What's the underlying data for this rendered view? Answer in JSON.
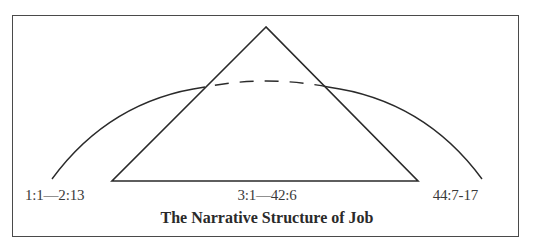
{
  "diagram": {
    "title": "The Narrative Structure of Job",
    "labels": {
      "prologue": "1:1—2:13",
      "dialogue": "3:1—42:6",
      "epilogue": "44:7-17"
    },
    "shapes": {
      "triangle": {
        "apex": [
          266,
          27
        ],
        "base_left": [
          112,
          181
        ],
        "base_right": [
          418,
          181
        ],
        "meaning": "central poetic section"
      },
      "arc": {
        "start": [
          52,
          179
        ],
        "end": [
          482,
          179
        ],
        "peak_y": 81,
        "dashed_inside_triangle": true,
        "meaning": "framing prose narrative"
      }
    },
    "colors": {
      "stroke": "#2a2a2a",
      "frame": "#4a4a4a",
      "background": "#ffffff"
    }
  }
}
